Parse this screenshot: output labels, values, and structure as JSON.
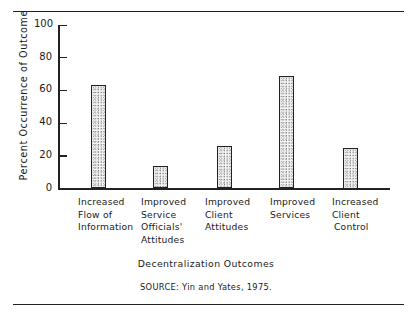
{
  "chart_data": {
    "type": "bar",
    "title": "",
    "xlabel": "Decentralization Outcomes",
    "ylabel": "Percent Occurrence of Outcome",
    "categories": [
      "Increased Flow of Information",
      "Improved Service Officials' Attitudes",
      "Improved Client Attitudes",
      "Improved Services",
      "Increased Client Control"
    ],
    "category_lines": [
      [
        "Increased",
        "Flow of",
        "Information"
      ],
      [
        "Improved",
        "Service",
        "Officials'",
        "Attitudes"
      ],
      [
        "Improved",
        "Client",
        "Attitudes"
      ],
      [
        "Improved",
        "Services"
      ],
      [
        "Increased",
        "Client",
        "Control"
      ]
    ],
    "values": [
      63,
      14,
      26,
      69,
      25
    ],
    "ylim": [
      0,
      100
    ],
    "yticks": [
      0,
      20,
      40,
      60,
      80,
      100
    ],
    "grid": false,
    "legend": null,
    "source": "SOURCE: Yin and Yates, 1975."
  },
  "labels": {
    "ylabel": "Percent Occurrence of Outcome",
    "xtitle": "Decentralization Outcomes",
    "source": "SOURCE: Yin and Yates, 1975.",
    "ticks": [
      "0",
      "20",
      "40",
      "60",
      "80",
      "100"
    ],
    "cat0": "Increased\nFlow of\nInformation",
    "cat1": "Improved\nService\nOfficials'\nAttitudes",
    "cat2": "Improved\nClient\nAttitudes",
    "cat3": "Improved\nServices",
    "cat4": "Increased\nClient\nControl"
  },
  "colors": {
    "ink": "#222222",
    "fill": "#f4f4f4"
  }
}
